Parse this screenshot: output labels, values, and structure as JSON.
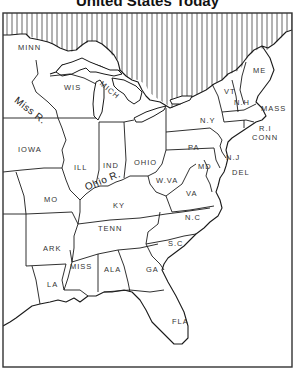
{
  "title": "United States Today",
  "colors": {
    "ink": "#1a1a1a",
    "water_hatch": "#555555",
    "land": "#ffffff",
    "frame": "#333333"
  },
  "states": [
    {
      "abbr": "MINN",
      "x": 18,
      "y": 47
    },
    {
      "abbr": "WIS",
      "x": 64,
      "y": 84
    },
    {
      "abbr": "MICH",
      "x": 103,
      "y": 82
    },
    {
      "abbr": "IOWA",
      "x": 18,
      "y": 146
    },
    {
      "abbr": "ILL",
      "x": 72,
      "y": 164
    },
    {
      "abbr": "IND",
      "x": 103,
      "y": 162
    },
    {
      "abbr": "OHIO",
      "x": 134,
      "y": 160
    },
    {
      "abbr": "MO",
      "x": 44,
      "y": 196
    },
    {
      "abbr": "KY",
      "x": 113,
      "y": 202
    },
    {
      "abbr": "W.VA",
      "x": 156,
      "y": 178
    },
    {
      "abbr": "VA",
      "x": 186,
      "y": 189
    },
    {
      "abbr": "PA",
      "x": 188,
      "y": 144
    },
    {
      "abbr": "N.Y",
      "x": 200,
      "y": 117
    },
    {
      "abbr": "ME",
      "x": 253,
      "y": 67
    },
    {
      "abbr": "VT",
      "x": 224,
      "y": 88
    },
    {
      "abbr": "N.H",
      "x": 234,
      "y": 99
    },
    {
      "abbr": "MASS",
      "x": 261,
      "y": 105
    },
    {
      "abbr": "R.I",
      "x": 259,
      "y": 126
    },
    {
      "abbr": "CONN",
      "x": 252,
      "y": 135
    },
    {
      "abbr": "N.J",
      "x": 226,
      "y": 155
    },
    {
      "abbr": "MD",
      "x": 198,
      "y": 163
    },
    {
      "abbr": "DEL",
      "x": 231,
      "y": 170
    },
    {
      "abbr": "TENN",
      "x": 98,
      "y": 225
    },
    {
      "abbr": "N.C",
      "x": 185,
      "y": 214
    },
    {
      "abbr": "ARK",
      "x": 43,
      "y": 246
    },
    {
      "abbr": "S.C",
      "x": 168,
      "y": 240
    },
    {
      "abbr": "MISS",
      "x": 70,
      "y": 263
    },
    {
      "abbr": "ALA",
      "x": 104,
      "y": 266
    },
    {
      "abbr": "GA",
      "x": 146,
      "y": 266
    },
    {
      "abbr": "LA",
      "x": 47,
      "y": 280
    },
    {
      "abbr": "FLA",
      "x": 172,
      "y": 318
    }
  ],
  "rivers": [
    {
      "name": "Miss R.",
      "x": 18,
      "y": 100,
      "rotate": 38
    },
    {
      "name": "Ohio R.",
      "x": 84,
      "y": 178,
      "rotate": -22
    }
  ]
}
